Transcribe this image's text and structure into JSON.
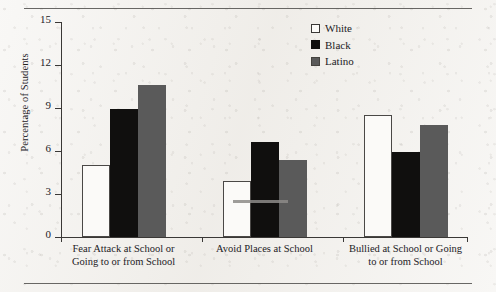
{
  "page": {
    "background_color": "#f1efeb",
    "rule_color": "#4f4d4b"
  },
  "legend": {
    "position": "top-right",
    "entries": [
      {
        "label": "White",
        "swatch": "white-swatch",
        "color": "#fcfbf9"
      },
      {
        "label": "Black",
        "swatch": "black-swatch",
        "color": "#100f0e"
      },
      {
        "label": "Latino",
        "swatch": "latino-swatch",
        "color": "#5a5a5a"
      }
    ]
  },
  "axes": {
    "y_title": "Percentage of Students",
    "y_ticks": [
      "0",
      "3",
      "6",
      "9",
      "12",
      "15"
    ]
  },
  "chart_data": {
    "type": "bar",
    "title": "",
    "xlabel": "",
    "ylabel": "Percentage of Students",
    "ylim": [
      0,
      15
    ],
    "yticks": [
      0,
      3,
      6,
      9,
      12,
      15
    ],
    "grid": false,
    "legend_position": "top right",
    "categories": [
      "Fear Attack at School or Going to or from School",
      "Avoid Places at School",
      "Bullied at School or Going to or from School"
    ],
    "category_lines": [
      [
        "Fear Attack at School or",
        "Going to or from School"
      ],
      [
        "Avoid Places at School"
      ],
      [
        "Bullied at School or Going",
        "to or from School"
      ]
    ],
    "series": [
      {
        "name": "White",
        "color": "#fcfbf9",
        "values": [
          5.0,
          3.9,
          8.5
        ]
      },
      {
        "name": "Black",
        "color": "#100f0e",
        "values": [
          8.9,
          6.6,
          5.9
        ]
      },
      {
        "name": "Latino",
        "color": "#5a5a5a",
        "values": [
          10.6,
          5.4,
          7.8
        ]
      }
    ]
  }
}
